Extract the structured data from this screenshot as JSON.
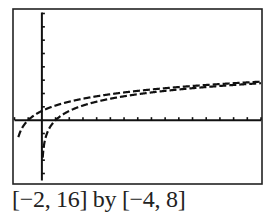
{
  "chart_data": {
    "type": "line",
    "title": "",
    "caption": "[−2, 16] by [−4, 8]",
    "xlim": [
      -2,
      16
    ],
    "ylim": [
      -4,
      8
    ],
    "xscale": 1,
    "yscale": 1,
    "grid": false,
    "legend": null,
    "xlabel": "",
    "ylabel": "",
    "series": [
      {
        "name": "y = ln(x + 2)",
        "style": "dashed-pixel",
        "x": [
          -1.7,
          -1.5,
          -1,
          -0.5,
          0,
          1,
          2,
          4,
          6,
          8,
          10,
          12,
          14,
          16
        ],
        "values": [
          -1.2,
          -0.69,
          0,
          0.41,
          0.69,
          1.1,
          1.39,
          1.79,
          2.08,
          2.3,
          2.48,
          2.64,
          2.77,
          2.89
        ]
      },
      {
        "name": "y = ln(x)",
        "style": "dashed-pixel",
        "x": [
          0.05,
          0.1,
          0.25,
          0.5,
          1,
          2,
          4,
          6,
          8,
          10,
          12,
          14,
          16
        ],
        "values": [
          -3.0,
          -2.3,
          -1.39,
          -0.69,
          0,
          0.69,
          1.39,
          1.79,
          2.08,
          2.3,
          2.48,
          2.64,
          2.77
        ]
      }
    ]
  }
}
